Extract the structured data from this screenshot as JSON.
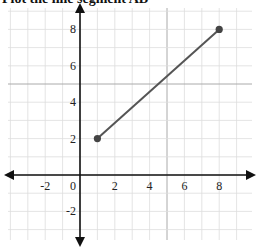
{
  "header": {
    "title": "Plot the line segment AB"
  },
  "chart_data": {
    "type": "line",
    "title": "Plot the line segment AB",
    "xlabel": "",
    "ylabel": "",
    "xlim": [
      -4.5,
      10
    ],
    "ylim": [
      -4,
      9.5
    ],
    "grid": true,
    "x_ticks": [
      -2,
      0,
      2,
      4,
      6,
      8
    ],
    "y_ticks": [
      8,
      6,
      4,
      2,
      -2
    ],
    "x_tick_labels": [
      "-2",
      "0",
      "2",
      "4",
      "6",
      "8"
    ],
    "y_tick_labels": [
      "8",
      "6",
      "4",
      "2",
      "-2"
    ],
    "series": [
      {
        "name": "Segment AB",
        "x": [
          1,
          8
        ],
        "y": [
          2,
          8
        ],
        "color": "#555555"
      }
    ],
    "points": [
      {
        "label": "A",
        "x": 1,
        "y": 2
      },
      {
        "label": "B",
        "x": 8,
        "y": 8
      }
    ]
  },
  "colors": {
    "grid": "#dddddd",
    "grid_major": "#aaaaaa",
    "axis": "#111111",
    "segment": "#555555"
  }
}
